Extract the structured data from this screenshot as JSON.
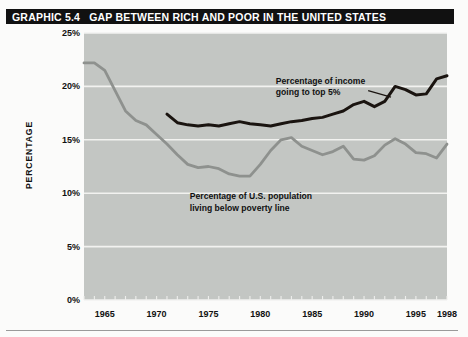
{
  "title": {
    "number": "GRAPHIC 5.4",
    "text": "GAP BETWEEN RICH AND POOR IN THE UNITED STATES"
  },
  "colors": {
    "plot_background": "#c3c6c3",
    "gridline": "#f2f2f0",
    "series_top5": "#1a1410",
    "series_poverty": "#8e918e",
    "title_bar": "#111111",
    "title_text": "#ffffff",
    "axis_text": "#111111"
  },
  "chart_data": {
    "type": "line",
    "title": "GAP BETWEEN RICH AND POOR IN THE UNITED STATES",
    "xlabel": "",
    "ylabel": "PERCENTAGE",
    "xlim": [
      1963,
      1998
    ],
    "ylim": [
      0,
      25
    ],
    "grid": true,
    "legend_position": "inline-annotations",
    "ytick_labels": [
      "0%",
      "5%",
      "10%",
      "15%",
      "20%",
      "25%"
    ],
    "ytick_values": [
      0,
      5,
      10,
      15,
      20,
      25
    ],
    "xtick_labels": [
      "1965",
      "1970",
      "1975",
      "1980",
      "1985",
      "1990",
      "1995",
      "1998"
    ],
    "xtick_values": [
      1965,
      1970,
      1975,
      1980,
      1985,
      1990,
      1995,
      1998
    ],
    "minor_xticks_every": 1,
    "series": [
      {
        "name": "Percentage of income going to top 5%",
        "color": "#1a1410",
        "x": [
          1971,
          1972,
          1973,
          1974,
          1975,
          1976,
          1977,
          1978,
          1979,
          1980,
          1981,
          1982,
          1983,
          1984,
          1985,
          1986,
          1987,
          1988,
          1989,
          1990,
          1991,
          1992,
          1993,
          1994,
          1995,
          1996,
          1997,
          1998
        ],
        "values": [
          17.4,
          16.6,
          16.4,
          16.3,
          16.4,
          16.3,
          16.5,
          16.7,
          16.5,
          16.4,
          16.3,
          16.5,
          16.7,
          16.8,
          17.0,
          17.1,
          17.4,
          17.7,
          18.3,
          18.6,
          18.1,
          18.6,
          20.0,
          19.7,
          19.2,
          19.3,
          20.7,
          21.0
        ]
      },
      {
        "name": "Percentage of U.S. population living below poverty line",
        "color": "#8e918e",
        "x": [
          1963,
          1964,
          1965,
          1966,
          1967,
          1968,
          1969,
          1970,
          1971,
          1972,
          1973,
          1974,
          1975,
          1976,
          1977,
          1978,
          1979,
          1980,
          1981,
          1982,
          1983,
          1984,
          1985,
          1986,
          1987,
          1988,
          1989,
          1990,
          1991,
          1992,
          1993,
          1994,
          1995,
          1996,
          1997,
          1998
        ],
        "values": [
          22.2,
          22.2,
          21.5,
          19.6,
          17.7,
          16.8,
          16.4,
          15.5,
          14.6,
          13.6,
          12.7,
          12.4,
          12.5,
          12.3,
          11.8,
          11.6,
          11.6,
          12.7,
          14.0,
          15.0,
          15.2,
          14.4,
          14.0,
          13.6,
          13.9,
          14.4,
          13.2,
          13.1,
          13.5,
          14.5,
          15.1,
          14.6,
          13.8,
          13.7,
          13.3,
          14.6
        ]
      }
    ],
    "annotations": [
      {
        "id": "annot-top5",
        "line1": "Percentage of income",
        "line2": "going to top 5%"
      },
      {
        "id": "annot-poverty",
        "line1": "Percentage of U.S. population",
        "line2": "living below poverty line"
      }
    ]
  }
}
